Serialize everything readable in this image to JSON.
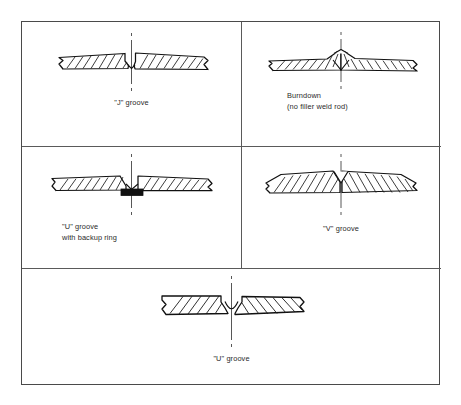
{
  "figure": {
    "page_mark": "",
    "line_color": "#1a1a1a",
    "hatch_color": "#1a1a1a",
    "border_color": "#4a4a4a",
    "backup_ring_color": "#111111",
    "background": "#ffffff"
  },
  "cells": [
    {
      "id": "j-groove",
      "caption": "\"J\" groove",
      "groove_type": "J",
      "description": "Two hatched plates butted at centerline with a J shaped groove on the upper right side",
      "has_backup_ring": false,
      "has_crown": false
    },
    {
      "id": "burndown",
      "caption": "Burndown\n(no filler weld rod)",
      "caption_line1": "Burndown",
      "caption_line2": "(no filler weld rod)",
      "groove_type": "Burndown",
      "description": "Plates with raised crown at the joint and a small V notch beneath, no filler rod used",
      "has_backup_ring": false,
      "has_crown": true
    },
    {
      "id": "u-groove-backup-ring",
      "caption": "\"U\" groove\nwith backup ring",
      "caption_line1": "\"U\" groove",
      "caption_line2": "with backup ring",
      "groove_type": "U",
      "description": "U shaped groove with a solid dark backup ring beneath the root of the joint",
      "has_backup_ring": true,
      "has_crown": false
    },
    {
      "id": "v-groove",
      "caption": "\"V\" groove",
      "groove_type": "V",
      "description": "Plates tapering upward to a peak at the centerline forming a V shaped groove",
      "has_backup_ring": false,
      "has_crown": true
    },
    {
      "id": "u-groove",
      "caption": "\"U\" groove",
      "groove_type": "U",
      "description": "Thick plates with a rounded U shaped groove at the joint centerline",
      "has_backup_ring": false,
      "has_crown": false
    }
  ]
}
